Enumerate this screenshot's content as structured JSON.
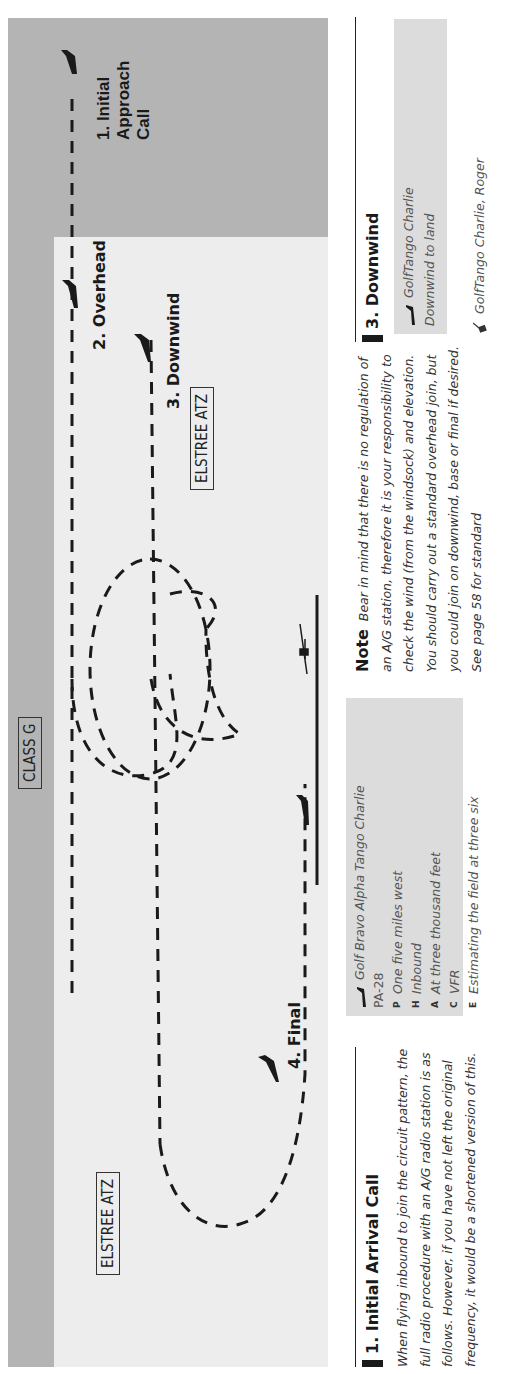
{
  "diagram": {
    "airspace_labels": {
      "class_g": "CLASS G",
      "atz_right": "ELSTREE ATZ",
      "atz_left": "ELSTREE ATZ"
    },
    "steps": {
      "initial_approach": [
        "1. Initial",
        "Approach",
        "Call"
      ],
      "overhead": "2. Overhead",
      "downwind": "3. Downwind",
      "final": "4. Final"
    },
    "colors": {
      "class_g_fill": "#b4b4b4",
      "atz_fill": "#ededed",
      "callbox_fill": "#dcdcdc"
    }
  },
  "sections": {
    "initial_arrival": {
      "heading": "1. Initial Arrival Call",
      "body": "When flying inbound to join the circuit pattern, the full radio procedure with an A/G radio station is as follows. However, if you have not left the original frequency, it would be a shortened version of this."
    },
    "call_box": {
      "callsign": "Golf Bravo Alpha Tango Charlie",
      "type": "PA-28",
      "rows": [
        {
          "letter": "P",
          "text": "One five miles west"
        },
        {
          "letter": "H",
          "text": "Inbound"
        },
        {
          "letter": "A",
          "text": "At three thousand feet"
        },
        {
          "letter": "C",
          "text": "VFR"
        },
        {
          "letter": "E",
          "text": "Estimating the field at three six"
        }
      ]
    },
    "note": {
      "label": "Note",
      "body": "Bear in mind that there is no regulation of an A/G station, therefore it is your responsibility to check the wind (from the windsock) and elevation. You should carry out a standard overhead join, but you could join on downwind, base or final if desired. See page 58 for standard"
    },
    "downwind": {
      "heading": "3. Downwind",
      "call_line1": "GolfTango Charlie",
      "call_line2": "Downwind to land",
      "reply": "GolfTango Charlie, Roger"
    }
  }
}
